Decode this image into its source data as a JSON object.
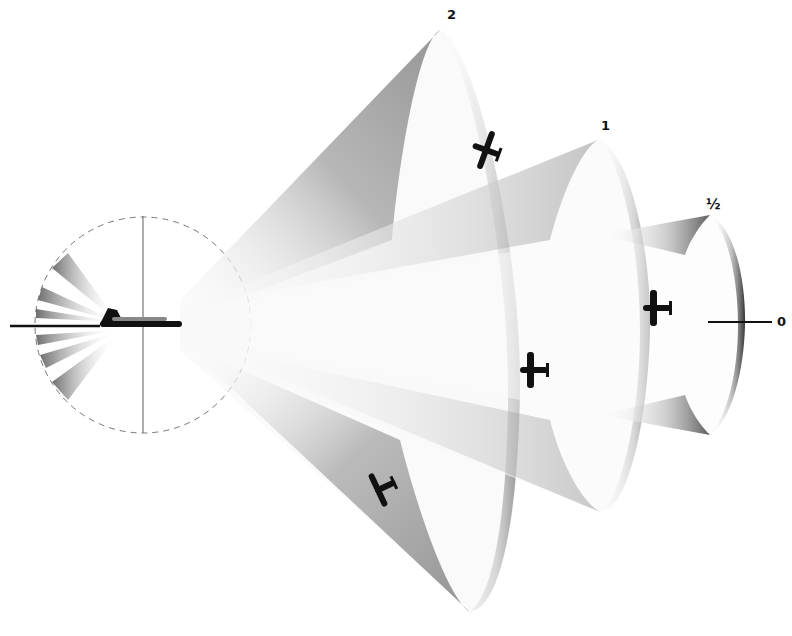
{
  "diagram": {
    "colors": {
      "ink": "#111111",
      "shade_dark": "#6e6e6e",
      "shade_mid": "#b5b5b5",
      "background": "#ffffff"
    },
    "cone_labels": [
      {
        "id": "cone-2",
        "text": "2"
      },
      {
        "id": "cone-1",
        "text": "1"
      },
      {
        "id": "cone-half",
        "text": "½"
      },
      {
        "id": "axis-zero",
        "text": "0"
      }
    ],
    "elements": {
      "bomber": "bomber-silhouette",
      "fighters": [
        "fighter-upper-cone-2",
        "fighter-lower-cone-2",
        "fighter-cone-1",
        "fighter-cone-half"
      ],
      "rear_fan_wedges": 6,
      "reference_circle": "dashed"
    }
  }
}
